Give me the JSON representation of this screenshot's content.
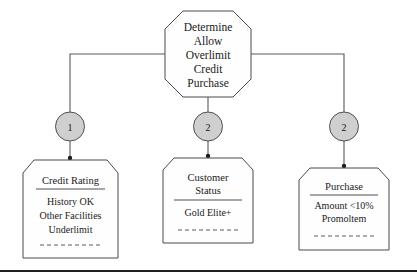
{
  "diagram": {
    "type": "crc-responsibility-collaboration-diagram",
    "root": {
      "shape": "octagon",
      "name": "determine-allow-overlimit-credit-purchase",
      "lines": [
        "Determine",
        "Allow",
        "Overlimit",
        "Credit",
        "Purchase"
      ]
    },
    "connectors": [
      {
        "from": "root",
        "to": "branch-1",
        "style": "orthogonal"
      },
      {
        "from": "root",
        "to": "branch-2",
        "style": "straight"
      },
      {
        "from": "root",
        "to": "branch-3",
        "style": "orthogonal"
      }
    ],
    "branches": [
      {
        "marker": {
          "shape": "circle",
          "label": "1",
          "fill": "#cfcfcf"
        },
        "card": {
          "name": "credit-rating",
          "title": "Credit Rating",
          "items": [
            "History OK",
            "Other Facilities",
            "Underlimit"
          ],
          "separator": "dashed"
        }
      },
      {
        "marker": {
          "shape": "circle",
          "label": "2",
          "fill": "#cfcfcf"
        },
        "card": {
          "name": "customer-status",
          "title": "Customer Status",
          "title_lines": [
            "Customer",
            "Status"
          ],
          "items": [
            "Gold Elite+"
          ],
          "separator": "dashed"
        }
      },
      {
        "marker": {
          "shape": "circle",
          "label": "2",
          "fill": "#cfcfcf"
        },
        "card": {
          "name": "purchase",
          "title": "Purchase",
          "items": [
            "Amount <10%",
            "Promoltem"
          ],
          "separator": "dashed"
        }
      }
    ],
    "colors": {
      "shape_stroke": "#4a4a4a",
      "shape_fill": "#fefefe",
      "circle_fill": "#cfcfcf",
      "connector": "#5a5a5a",
      "text": "#1a1a1a",
      "bottom_rule": "#202020"
    }
  }
}
